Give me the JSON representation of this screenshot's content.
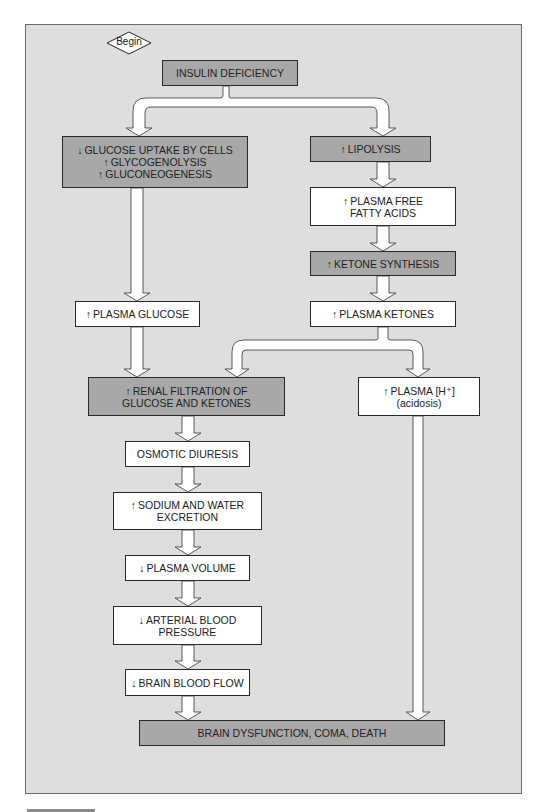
{
  "diagram": {
    "start_label": "Begin",
    "colors": {
      "panel_background": "#dedede",
      "dark_box": "#a8a8a8",
      "light_box": "#ffffff",
      "border": "#2a2a2a"
    },
    "nodes": {
      "insulin_deficiency": {
        "lines": [
          "INSULIN DEFICIENCY"
        ],
        "style": "dark"
      },
      "glucose_uptake": {
        "lines": [
          {
            "dir": "down",
            "text": "GLUCOSE UPTAKE BY CELLS"
          },
          {
            "dir": "up",
            "text": "GLYCOGENOLYSIS"
          },
          {
            "dir": "up",
            "text": "GLUCONEOGENESIS"
          }
        ],
        "style": "dark"
      },
      "lipolysis": {
        "lines": [
          {
            "dir": "up",
            "text": "LIPOLYSIS"
          }
        ],
        "style": "dark"
      },
      "plasma_ffa": {
        "lines": [
          {
            "dir": "up",
            "text": "PLASMA FREE"
          },
          {
            "dir": "",
            "text": "FATTY ACIDS"
          }
        ],
        "style": "light"
      },
      "ketone_synthesis": {
        "lines": [
          {
            "dir": "up",
            "text": "KETONE SYNTHESIS"
          }
        ],
        "style": "dark"
      },
      "plasma_ketones": {
        "lines": [
          {
            "dir": "up",
            "text": "PLASMA KETONES"
          }
        ],
        "style": "light"
      },
      "plasma_glucose": {
        "lines": [
          {
            "dir": "up",
            "text": "PLASMA GLUCOSE"
          }
        ],
        "style": "light"
      },
      "renal_filtration": {
        "lines": [
          {
            "dir": "up",
            "text": "RENAL FILTRATION OF"
          },
          {
            "dir": "",
            "text": "GLUCOSE AND KETONES"
          }
        ],
        "style": "dark"
      },
      "plasma_h": {
        "lines": [
          {
            "dir": "up",
            "text": "PLASMA [H⁺]"
          },
          {
            "dir": "",
            "text": "(acidosis)"
          }
        ],
        "style": "light"
      },
      "osmotic_diuresis": {
        "lines": [
          {
            "dir": "",
            "text": "OSMOTIC DIURESIS"
          }
        ],
        "style": "light"
      },
      "sodium_water": {
        "lines": [
          {
            "dir": "up",
            "text": "SODIUM AND WATER"
          },
          {
            "dir": "",
            "text": "EXCRETION"
          }
        ],
        "style": "light"
      },
      "plasma_volume": {
        "lines": [
          {
            "dir": "down",
            "text": "PLASMA VOLUME"
          }
        ],
        "style": "light"
      },
      "arterial_bp": {
        "lines": [
          {
            "dir": "down",
            "text": "ARTERIAL BLOOD"
          },
          {
            "dir": "",
            "text": "PRESSURE"
          }
        ],
        "style": "light"
      },
      "brain_blood_flow": {
        "lines": [
          {
            "dir": "down",
            "text": "BRAIN BLOOD FLOW"
          }
        ],
        "style": "light"
      },
      "brain_dysfunction": {
        "lines": [
          {
            "dir": "",
            "text": "BRAIN DYSFUNCTION, COMA, DEATH"
          }
        ],
        "style": "dark"
      }
    },
    "edges": [
      [
        "insulin_deficiency",
        "glucose_uptake"
      ],
      [
        "insulin_deficiency",
        "lipolysis"
      ],
      [
        "lipolysis",
        "plasma_ffa"
      ],
      [
        "plasma_ffa",
        "ketone_synthesis"
      ],
      [
        "ketone_synthesis",
        "plasma_ketones"
      ],
      [
        "glucose_uptake",
        "plasma_glucose"
      ],
      [
        "plasma_glucose",
        "renal_filtration"
      ],
      [
        "plasma_ketones",
        "renal_filtration"
      ],
      [
        "plasma_ketones",
        "plasma_h"
      ],
      [
        "renal_filtration",
        "osmotic_diuresis"
      ],
      [
        "osmotic_diuresis",
        "sodium_water"
      ],
      [
        "sodium_water",
        "plasma_volume"
      ],
      [
        "plasma_volume",
        "arterial_bp"
      ],
      [
        "arterial_bp",
        "brain_blood_flow"
      ],
      [
        "brain_blood_flow",
        "brain_dysfunction"
      ],
      [
        "plasma_h",
        "brain_dysfunction"
      ]
    ]
  }
}
